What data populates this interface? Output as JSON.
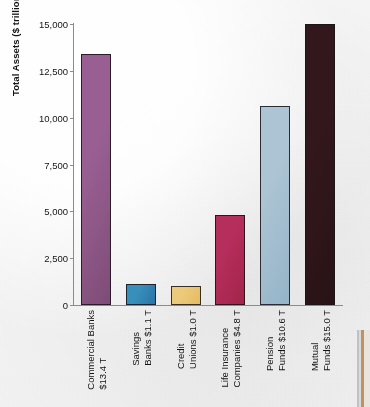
{
  "chart_data": {
    "type": "bar",
    "title": "",
    "xlabel": "",
    "ylabel": "Total Assets ($ trillions)",
    "ylim": [
      0,
      15000
    ],
    "ytick_values": [
      0,
      2500,
      5000,
      7500,
      10000,
      12500,
      15000
    ],
    "ytick_labels": [
      "0",
      "2,500",
      "5,000",
      "7,500",
      "10,000",
      "12,500",
      "15,000"
    ],
    "grid": false,
    "legend": false,
    "units_note": "Bar values are in $ billions on the axis; category labels state $ trillions.",
    "categories": [
      "Commercial Banks $13.4 T",
      "Savings Banks $1.1 T",
      "Credit Unions $1.0 T",
      "Life Insurance Companies $4.8 T",
      "Pension Funds $10.6 T",
      "Mutual Funds $15.0 T"
    ],
    "values": [
      13400,
      1100,
      1000,
      4800,
      10600,
      15000
    ],
    "bars": [
      {
        "line1": "Commercial Banks",
        "line2": "$13.4 T",
        "value": 13400,
        "value_label": "$13.4 T",
        "color": "#86527f"
      },
      {
        "line1": "Savings",
        "line2": "Banks $1.1 T",
        "value": 1100,
        "value_label": "$1.1 T",
        "color": "#2f7cad"
      },
      {
        "line1": "Credit",
        "line2": "Unions $1.0 T",
        "value": 1000,
        "value_label": "$1.0 T",
        "color": "#e8c06a"
      },
      {
        "line1": "Life Insurance",
        "line2": "Companies $4.8 T",
        "value": 4800,
        "value_label": "$4.8 T",
        "color": "#a8274f"
      },
      {
        "line1": "Pension",
        "line2": "Funds $10.6 T",
        "value": 10600,
        "value_label": "$10.6 T",
        "color": "#9cb9cc"
      },
      {
        "line1": "Mutual",
        "line2": "Funds $15.0 T",
        "value": 15000,
        "value_label": "$15.0 T",
        "color": "#2b1418"
      }
    ]
  },
  "colors": {
    "background": "#f6f6f7",
    "axis": "#8b8b8b",
    "text": "#141414"
  }
}
